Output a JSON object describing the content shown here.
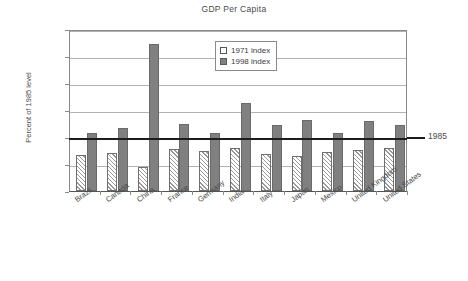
{
  "chart_data": {
    "type": "bar",
    "title": "GDP Per Capita",
    "xlabel": "",
    "ylabel": "Percent of 1985 level",
    "ylim": [
      0,
      300
    ],
    "yticks": [
      "0%",
      "50%",
      "100%",
      "150%",
      "200%",
      "250%",
      "300%"
    ],
    "ytick_values": [
      0,
      50,
      100,
      150,
      200,
      250,
      300
    ],
    "grid": true,
    "legend_position": "inside-top-center",
    "categories": [
      "Brazil",
      "Canada",
      "China",
      "France",
      "Germany",
      "India",
      "Italy",
      "Japan",
      "Mexico",
      "United Kingdom",
      "United States"
    ],
    "series": [
      {
        "name": "1971 index",
        "values": [
          66,
          70,
          45,
          77,
          74,
          79,
          69,
          65,
          73,
          76,
          79
        ]
      },
      {
        "name": "1998 index",
        "values": [
          107,
          116,
          272,
          124,
          107,
          163,
          123,
          131,
          108,
          129,
          123
        ]
      }
    ],
    "annotations": [
      {
        "name": "reference-line-1985",
        "label": "1985",
        "value": 100,
        "orientation": "horizontal"
      }
    ]
  },
  "legend": {
    "items": [
      {
        "label": "1971 index",
        "swatch": "white-hatched"
      },
      {
        "label": "1998 index",
        "swatch": "dark-gray"
      }
    ]
  },
  "colors": {
    "bar_1998": "#808080",
    "bar_1971": "#ffffff",
    "gridline": "#b2b2b2",
    "reference_line": "#1c1c1c",
    "axis": "#8a8a8a",
    "text": "#4a4a4a"
  }
}
